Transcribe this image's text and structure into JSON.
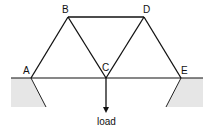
{
  "nodes": {
    "A": {
      "label": "A",
      "x": 31,
      "y": 78
    },
    "B": {
      "label": "B",
      "x": 68,
      "y": 17
    },
    "C": {
      "label": "C",
      "x": 106,
      "y": 78
    },
    "D": {
      "label": "D",
      "x": 144,
      "y": 17
    },
    "E": {
      "label": "E",
      "x": 181,
      "y": 78
    }
  },
  "members": [
    [
      "A",
      "B"
    ],
    [
      "B",
      "C"
    ],
    [
      "C",
      "D"
    ],
    [
      "D",
      "E"
    ],
    [
      "B",
      "D"
    ],
    [
      "A",
      "E"
    ]
  ],
  "load": {
    "label": "load",
    "at": "C"
  },
  "colors": {
    "line": "#111111",
    "ground": "#e6e6e6"
  }
}
